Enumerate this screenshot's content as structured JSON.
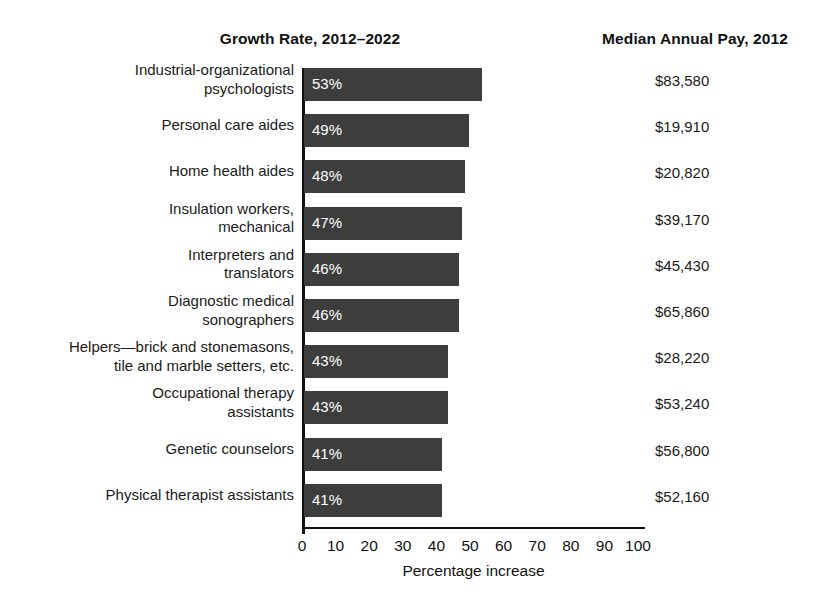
{
  "headers": {
    "growth": "Growth Rate, 2012–2022",
    "pay": "Median Annual Pay, 2012"
  },
  "axis": {
    "xlabel": "Percentage increase",
    "ticks": [
      "0",
      "10",
      "20",
      "30",
      "40",
      "50",
      "60",
      "70",
      "80",
      "90",
      "100"
    ]
  },
  "colors": {
    "bar": "#3d3d3d",
    "bar_label": "#ffffff",
    "text": "#1a1a1a",
    "axis": "#111111",
    "background": "#ffffff"
  },
  "rows": [
    {
      "category": "Industrial-organizational\npsychologists",
      "lines": 2,
      "percent": 53,
      "percent_label": "53%",
      "pay": "$83,580"
    },
    {
      "category": "Personal care aides",
      "lines": 1,
      "percent": 49,
      "percent_label": "49%",
      "pay": "$19,910"
    },
    {
      "category": "Home health aides",
      "lines": 1,
      "percent": 48,
      "percent_label": "48%",
      "pay": "$20,820"
    },
    {
      "category": "Insulation workers,\nmechanical",
      "lines": 2,
      "percent": 47,
      "percent_label": "47%",
      "pay": "$39,170"
    },
    {
      "category": "Interpreters and\ntranslators",
      "lines": 2,
      "percent": 46,
      "percent_label": "46%",
      "pay": "$45,430"
    },
    {
      "category": "Diagnostic medical\nsonographers",
      "lines": 2,
      "percent": 46,
      "percent_label": "46%",
      "pay": "$65,860"
    },
    {
      "category": "Helpers—brick and stonemasons,\ntile and marble setters, etc.",
      "lines": 2,
      "percent": 43,
      "percent_label": "43%",
      "pay": "$28,220"
    },
    {
      "category": "Occupational therapy\nassistants",
      "lines": 2,
      "percent": 43,
      "percent_label": "43%",
      "pay": "$53,240"
    },
    {
      "category": "Genetic counselors",
      "lines": 1,
      "percent": 41,
      "percent_label": "41%",
      "pay": "$56,800"
    },
    {
      "category": "Physical therapist assistants",
      "lines": 1,
      "percent": 41,
      "percent_label": "41%",
      "pay": "$52,160"
    }
  ],
  "chart_data": {
    "type": "bar",
    "orientation": "horizontal",
    "title": "Growth Rate, 2012–2022",
    "xlabel": "Percentage increase",
    "ylabel": "",
    "xlim": [
      0,
      100
    ],
    "xticks": [
      0,
      10,
      20,
      30,
      40,
      50,
      60,
      70,
      80,
      90,
      100
    ],
    "grid": false,
    "legend": "none",
    "categories": [
      "Industrial-organizational psychologists",
      "Personal care aides",
      "Home health aides",
      "Insulation workers, mechanical",
      "Interpreters and translators",
      "Diagnostic medical sonographers",
      "Helpers—brick and stonemasons, tile and marble setters, etc.",
      "Occupational therapy assistants",
      "Genetic counselors",
      "Physical therapist assistants"
    ],
    "values": [
      53,
      49,
      48,
      47,
      46,
      46,
      43,
      43,
      41,
      41
    ],
    "value_labels": [
      "53%",
      "49%",
      "48%",
      "47%",
      "46%",
      "46%",
      "43%",
      "43%",
      "41%",
      "41%"
    ],
    "annotations": {
      "column_title": "Median Annual Pay, 2012",
      "values": [
        "$83,580",
        "$19,910",
        "$20,820",
        "$39,170",
        "$45,430",
        "$65,860",
        "$28,220",
        "$53,240",
        "$56,800",
        "$52,160"
      ]
    }
  }
}
